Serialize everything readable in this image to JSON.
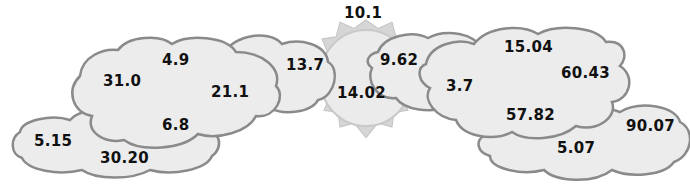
{
  "scene": {
    "cloud_fill": "#ececec",
    "cloud_stroke": "#8a8a8a",
    "sun_fill": "#e6e6e6",
    "sun_ray_fill": "#cfcfcf"
  },
  "sun": {
    "numbers": [
      "10.1",
      "14.02"
    ]
  },
  "left_clouds": {
    "main": [
      "4.9",
      "31.0",
      "21.1",
      "6.8"
    ],
    "bottom": [
      "5.15",
      "30.20"
    ],
    "back": [
      "13.7"
    ]
  },
  "right_clouds": {
    "small": [
      "9.62"
    ],
    "main": [
      "15.04",
      "3.7",
      "60.43",
      "57.82"
    ],
    "bottom": [
      "90.07",
      "5.07"
    ]
  }
}
